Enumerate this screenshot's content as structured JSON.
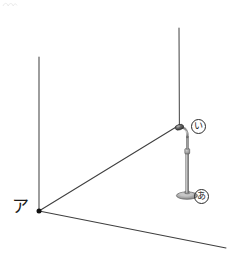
{
  "figure": {
    "kind": "perspective-room-corner-diagram",
    "canvas": {
      "width": 230,
      "height": 273
    },
    "background_color": "#ffffff",
    "line_color": "#3a3a3a",
    "vertex_color": "#111111",
    "labels": {
      "corner_vertex": "ア",
      "circled_upper": "い",
      "circled_lower": "あ"
    },
    "geometry": {
      "corner_vertex": {
        "x": 39,
        "y": 211
      },
      "left_wall_edge": {
        "x1": 39,
        "y1": 57,
        "x2": 39,
        "y2": 211
      },
      "right_wall_edge": {
        "x1": 179,
        "y1": 28,
        "x2": 179,
        "y2": 125
      },
      "wall_junction_line": {
        "x1": 39,
        "y1": 211,
        "x2": 179,
        "y2": 125
      },
      "floor_front_edge": {
        "x1": 39,
        "y1": 211,
        "x2": 226,
        "y2": 248
      }
    },
    "microphone_stand": {
      "head": {
        "cx": 178.5,
        "cy": 127.5,
        "rx": 4.2,
        "ry": 2.6
      },
      "gooseneck": "curved-arm",
      "pole": {
        "x": 187.5,
        "y_top": 137,
        "y_bottom": 193
      },
      "collar": {
        "cy": 152
      },
      "base": {
        "cx": 187,
        "cy": 195.5,
        "rx": 10.5,
        "ry": 3.6
      },
      "metal_light": "#d8d8d8",
      "metal_mid": "#a8a8a8",
      "metal_dark": "#6e6e6e"
    }
  }
}
